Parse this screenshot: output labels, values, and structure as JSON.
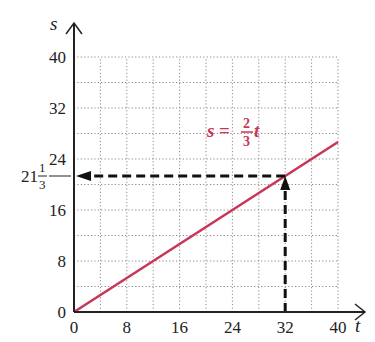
{
  "chart_data": {
    "type": "line",
    "title": "",
    "xlabel": "t",
    "ylabel": "s",
    "xlim": [
      0,
      40
    ],
    "ylim": [
      0,
      40
    ],
    "x_ticks": [
      "0",
      "8",
      "16",
      "24",
      "32",
      "40"
    ],
    "y_ticks": [
      "0",
      "8",
      "16",
      "24",
      "32",
      "40"
    ],
    "grid": true,
    "grid_minor_step": 4,
    "series": [
      {
        "name": "s = 2/3 t",
        "x": [
          0,
          40
        ],
        "y": [
          0,
          26.67
        ],
        "color": "#c8365a"
      }
    ],
    "annotations": [
      {
        "type": "equation_label",
        "text": "s = 2/3 t",
        "lhs": "s",
        "equals": "=",
        "numerator": "2",
        "denominator": "3",
        "variable": "t",
        "color": "#c8365a"
      },
      {
        "type": "dashed_arrow",
        "description": "vertical dashed arrow from t=32 up to the line",
        "from": [
          32,
          0
        ],
        "to": [
          32,
          21.33
        ]
      },
      {
        "type": "dashed_arrow",
        "description": "horizontal dashed arrow from the line to the s-axis",
        "from": [
          32,
          21.33
        ],
        "to": [
          0,
          21.33
        ]
      },
      {
        "type": "axis_marker",
        "value": 21.33,
        "whole": "21",
        "numerator": "1",
        "denominator": "3"
      }
    ]
  },
  "labels": {
    "x_axis": "t",
    "y_axis": "s",
    "origin_x": "0",
    "origin_y": "0",
    "marker_whole": "21",
    "marker_num": "1",
    "marker_den": "3",
    "eq_lhs": "s",
    "eq_equals": "=",
    "eq_num": "2",
    "eq_den": "3",
    "eq_var": "t"
  },
  "colors": {
    "line": "#c8365a",
    "axis": "#222222",
    "grid": "#8a8a8a"
  }
}
